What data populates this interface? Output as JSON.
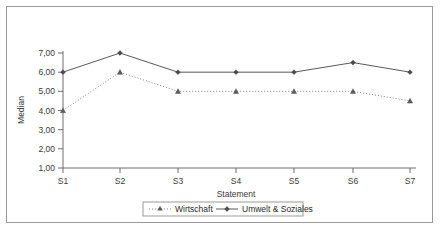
{
  "chart_data": {
    "type": "line",
    "title": "",
    "xlabel": "Statement",
    "ylabel": "Median",
    "categories": [
      "S1",
      "S2",
      "S3",
      "S4",
      "S5",
      "S6",
      "S7"
    ],
    "ylim": [
      1.0,
      7.0
    ],
    "ytick_labels": [
      "1,00",
      "2,00",
      "3,00",
      "4,00",
      "5,00",
      "6,00",
      "7,00"
    ],
    "ytick_values": [
      1.0,
      2.0,
      3.0,
      4.0,
      5.0,
      6.0,
      7.0
    ],
    "grid": false,
    "legend_position": "bottom-center",
    "series": [
      {
        "name": "Wirtschaft",
        "values": [
          4.0,
          6.0,
          5.0,
          5.0,
          5.0,
          5.0,
          4.5
        ],
        "line_style": "dotted",
        "marker": "triangle",
        "color": "#808080"
      },
      {
        "name": "Umwelt & Soziales",
        "values": [
          6.0,
          7.0,
          6.0,
          6.0,
          6.0,
          6.5,
          6.0
        ],
        "line_style": "solid",
        "marker": "diamond",
        "color": "#595959"
      }
    ]
  },
  "axes": {
    "y_axis_title": "Median",
    "x_axis_title": "Statement",
    "y_labels": [
      "7,00",
      "6,00",
      "5,00",
      "4,00",
      "3,00",
      "2,00",
      "1,00"
    ],
    "x_labels": [
      "S1",
      "S2",
      "S3",
      "S4",
      "S5",
      "S6",
      "S7"
    ]
  },
  "legend": {
    "entries": [
      {
        "label": "Wirtschaft",
        "marker": "triangle-marker",
        "line": "dotted-line"
      },
      {
        "label": "Umwelt & Soziales",
        "marker": "diamond-marker",
        "line": "solid-line"
      }
    ]
  },
  "colors": {
    "frame": "#9a9a9a",
    "axis": "#6e6e6e",
    "series_wirtschaft": "#808080",
    "series_umwelt": "#595959",
    "text": "#3a3a3a",
    "background": "#ffffff"
  }
}
